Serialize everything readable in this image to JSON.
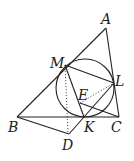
{
  "diagram": {
    "type": "geometry",
    "points": {
      "A": {
        "label": "A",
        "x": 106,
        "y": 28
      },
      "M": {
        "label": "M",
        "x": 65,
        "y": 65
      },
      "L": {
        "label": "L",
        "x": 114,
        "y": 83
      },
      "E": {
        "label": "E",
        "x": 80,
        "y": 97
      },
      "B": {
        "label": "B",
        "x": 17,
        "y": 117
      },
      "K": {
        "label": "K",
        "x": 84,
        "y": 117
      },
      "C": {
        "label": "C",
        "x": 119,
        "y": 117
      },
      "D": {
        "label": "D",
        "x": 69,
        "y": 135
      }
    },
    "circle": {
      "cx": 85,
      "cy": 88,
      "r": 29
    },
    "solid_segments": [
      [
        "A",
        "B"
      ],
      [
        "A",
        "C"
      ],
      [
        "B",
        "C"
      ],
      [
        "M",
        "L"
      ],
      [
        "M",
        "K"
      ],
      [
        "B",
        "D"
      ],
      [
        "D",
        "L"
      ],
      [
        "E",
        "C"
      ]
    ],
    "dotted_segments": [
      [
        "M",
        "D"
      ],
      [
        "E",
        "L"
      ]
    ],
    "labels": {
      "A": "A",
      "M": "M",
      "L": "L",
      "E": "E",
      "B": "B",
      "K": "K",
      "C": "C",
      "D": "D"
    }
  }
}
